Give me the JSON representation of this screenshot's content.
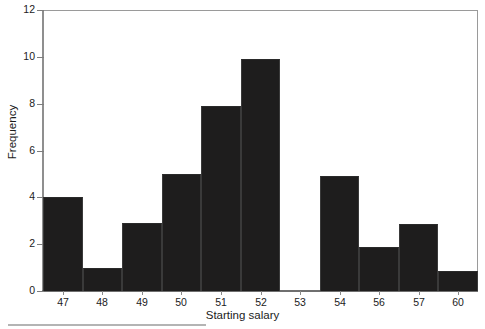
{
  "figure": {
    "xtitle": "Starting salary",
    "ytitle": "Frequency"
  },
  "colors": {
    "bar": "#1e1d1d",
    "frame": "#9a9a9a",
    "text": "#1b1b1b",
    "background": "#ffffff"
  },
  "chart_data": {
    "type": "bar",
    "title": "",
    "subtitle": "",
    "xlabel": "Starting salary",
    "ylabel": "Frequency",
    "categories": [
      "47",
      "48",
      "49",
      "50",
      "51",
      "52",
      "53",
      "54",
      "56",
      "57",
      "60"
    ],
    "values": [
      4,
      1,
      2.9,
      5,
      7.9,
      9.9,
      0,
      4.9,
      1.9,
      2.85,
      0.85
    ],
    "xlim": [
      46.5,
      60.5
    ],
    "ylim": [
      0,
      12
    ],
    "ytick_labels": [
      "0",
      "2",
      "4",
      "6",
      "8",
      "10",
      "12"
    ],
    "ytick_values": [
      0,
      2,
      4,
      6,
      8,
      10,
      12
    ],
    "xtick_labels": [
      "47",
      "48",
      "49",
      "50",
      "51",
      "52",
      "53",
      "54",
      "56",
      "57",
      "60"
    ],
    "grid": false,
    "legend": false,
    "legend_position": "none",
    "bars": [
      {
        "label": "47",
        "value": 4
      },
      {
        "label": "48",
        "value": 1
      },
      {
        "label": "49",
        "value": 2.9
      },
      {
        "label": "50",
        "value": 5
      },
      {
        "label": "51",
        "value": 7.9
      },
      {
        "label": "52",
        "value": 9.9
      },
      {
        "label": "53",
        "value": 0
      },
      {
        "label": "54",
        "value": 4.9
      },
      {
        "label": "56",
        "value": 1.9
      },
      {
        "label": "57",
        "value": 2.85
      },
      {
        "label": "60",
        "value": 0.85
      }
    ],
    "annotations": []
  }
}
